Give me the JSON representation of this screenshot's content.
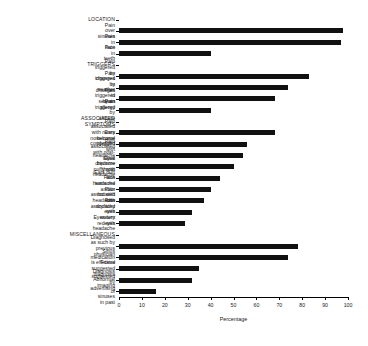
{
  "chart_data": {
    "type": "bar",
    "orientation": "horizontal",
    "title": "",
    "xlabel": "Percentage",
    "ylabel": "",
    "xlim": [
      0,
      100
    ],
    "xticks": [
      0,
      10,
      20,
      30,
      40,
      50,
      60,
      70,
      80,
      90,
      100
    ],
    "grid": false,
    "legend": null,
    "bar_color": "#111111",
    "categories": [
      "LOCATION",
      "Pain over sinuses",
      "Pain in face",
      "Pain in teeth",
      "TRIGGERS",
      "Pain triggered by changes in weather",
      "Pain triggered by changes in season",
      "Pain triggered by an allergy",
      "Pain triggered by altitude",
      "ASSOCIATED SYMPTOMS",
      "Pain associated with runny\nnose/nasal congestion",
      "Ears become plugged with headache",
      "Pain associated with post-nasal\ndrip/sore throat",
      "Eyes become puffy with headache",
      "Ears hurt with headache",
      "Face turns red and/or hot with\nheadache",
      "Pain associated with dry/itchy eyes",
      "Pain associated with watery eyes",
      "Eyes turn red with headache",
      "MISCELLANEOUS",
      "Diagnosed as such by previous\nphysician",
      "Sinus medication is effective",
      "Friend suggested diagnosis",
      "Diagnosis suggested by advertising",
      "Abnormal imaging of sinuses in past"
    ],
    "is_header": [
      true,
      false,
      false,
      false,
      true,
      false,
      false,
      false,
      false,
      true,
      false,
      false,
      false,
      false,
      false,
      false,
      false,
      false,
      false,
      true,
      false,
      false,
      false,
      false,
      false
    ],
    "values": [
      null,
      98,
      97,
      40,
      null,
      83,
      74,
      68,
      40,
      null,
      68,
      56,
      54,
      50,
      44,
      40,
      37,
      32,
      29,
      null,
      78,
      74,
      35,
      32,
      16
    ]
  }
}
